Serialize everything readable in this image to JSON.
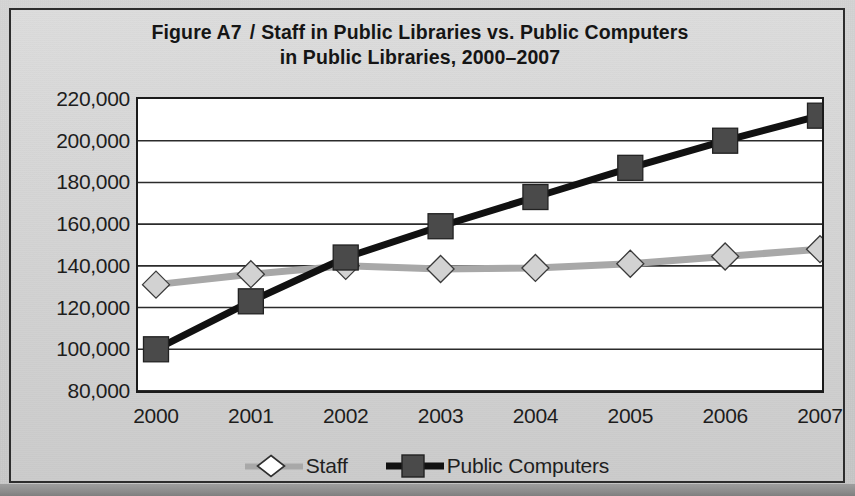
{
  "figure": {
    "label": "Figure A7",
    "separator": "/",
    "title_line1": "Staff in Public Libraries vs. Public Computers",
    "title_line2": "in Public Libraries, 2000–2007"
  },
  "colors": {
    "staff_line": "#a8a8a8",
    "staff_marker_fill": "#d2d2d2",
    "staff_marker_stroke": "#3a3a3a",
    "computers_line": "#111111",
    "computers_marker_fill": "#4a4a4a",
    "computers_marker_stroke": "#222222",
    "axis": "#1b1b1b",
    "gridline": "#2b2b2b",
    "plot_background": "#ffffff",
    "page_background": "#d2d2d2"
  },
  "chart_data": {
    "type": "line",
    "xlabel": "",
    "ylabel": "",
    "categories": [
      "2000",
      "2001",
      "2002",
      "2003",
      "2004",
      "2005",
      "2006",
      "2007"
    ],
    "x": [
      2000,
      2001,
      2002,
      2003,
      2004,
      2005,
      2006,
      2007
    ],
    "series": [
      {
        "name": "Staff",
        "marker": "diamond",
        "values": [
          131000,
          136000,
          140000,
          138500,
          139000,
          141000,
          144500,
          148000
        ]
      },
      {
        "name": "Public Computers",
        "marker": "square",
        "values": [
          100000,
          123000,
          144000,
          159000,
          173000,
          187000,
          200000,
          212000
        ]
      }
    ],
    "ylim": [
      80000,
      220000
    ],
    "ytick_step": 20000,
    "ytick_labels": [
      "220,000",
      "200,000",
      "180,000",
      "160,000",
      "140,000",
      "120,000",
      "100,000",
      "80,000"
    ],
    "ytick_values": [
      220000,
      200000,
      180000,
      160000,
      140000,
      120000,
      100000,
      80000
    ],
    "grid": true,
    "grid_axis": "y",
    "legend_position": "bottom"
  },
  "legend": {
    "items": [
      {
        "label": "Staff",
        "marker": "diamond-hollow-icon"
      },
      {
        "label": "Public Computers",
        "marker": "square-filled-icon"
      }
    ]
  }
}
